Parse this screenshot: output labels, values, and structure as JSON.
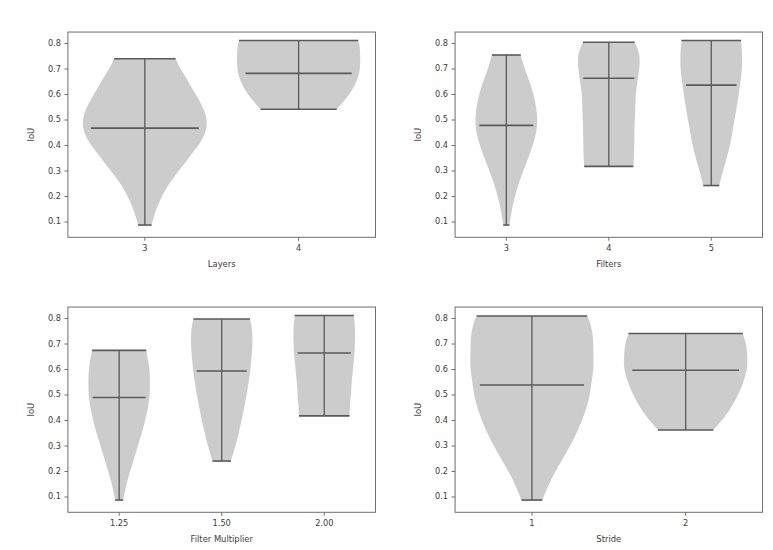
{
  "figure": {
    "kind": "violin-plot-grid",
    "rows": 2,
    "cols": 2,
    "shared_ylabel": "IoU",
    "fill_color": "#c8c8c8",
    "line_color": "#5a5a5a",
    "axis_color": "#6e6e6e",
    "background": "#ffffff"
  },
  "chart_data": [
    {
      "type": "violin",
      "panel": "top-left",
      "title": "",
      "xlabel": "Layers",
      "ylabel": "IoU",
      "ylim": [
        0.04,
        0.845
      ],
      "yticks": [
        0.1,
        0.2,
        0.3,
        0.4,
        0.5,
        0.6,
        0.7,
        0.8
      ],
      "ytick_labels": [
        "0.1",
        "0.2",
        "0.3",
        "0.4",
        "0.5",
        "0.6",
        "0.7",
        "0.8"
      ],
      "categories": [
        "3",
        "4"
      ],
      "grid": false,
      "legend": "none",
      "groups": [
        {
          "label": "3",
          "min": 0.088,
          "max": 0.74,
          "mean": 0.468,
          "max_width": 0.4,
          "profile": [
            {
              "y": 0.088,
              "w": 0.11
            },
            {
              "y": 0.13,
              "w": 0.16
            },
            {
              "y": 0.18,
              "w": 0.24
            },
            {
              "y": 0.24,
              "w": 0.37
            },
            {
              "y": 0.3,
              "w": 0.55
            },
            {
              "y": 0.36,
              "w": 0.74
            },
            {
              "y": 0.42,
              "w": 0.92
            },
            {
              "y": 0.47,
              "w": 1.0
            },
            {
              "y": 0.52,
              "w": 0.99
            },
            {
              "y": 0.57,
              "w": 0.9
            },
            {
              "y": 0.62,
              "w": 0.78
            },
            {
              "y": 0.67,
              "w": 0.66
            },
            {
              "y": 0.71,
              "w": 0.56
            },
            {
              "y": 0.74,
              "w": 0.5
            }
          ]
        },
        {
          "label": "4",
          "min": 0.542,
          "max": 0.812,
          "mean": 0.683,
          "max_width": 0.4,
          "profile": [
            {
              "y": 0.542,
              "w": 0.62
            },
            {
              "y": 0.57,
              "w": 0.72
            },
            {
              "y": 0.6,
              "w": 0.82
            },
            {
              "y": 0.64,
              "w": 0.92
            },
            {
              "y": 0.68,
              "w": 0.98
            },
            {
              "y": 0.72,
              "w": 1.0
            },
            {
              "y": 0.76,
              "w": 1.0
            },
            {
              "y": 0.79,
              "w": 0.99
            },
            {
              "y": 0.812,
              "w": 0.97
            }
          ]
        }
      ]
    },
    {
      "type": "violin",
      "panel": "top-right",
      "title": "",
      "xlabel": "Filters",
      "ylabel": "IoU",
      "ylim": [
        0.04,
        0.845
      ],
      "yticks": [
        0.1,
        0.2,
        0.3,
        0.4,
        0.5,
        0.6,
        0.7,
        0.8
      ],
      "ytick_labels": [
        "0.1",
        "0.2",
        "0.3",
        "0.4",
        "0.5",
        "0.6",
        "0.7",
        "0.8"
      ],
      "categories": [
        "3",
        "4",
        "5"
      ],
      "grid": false,
      "legend": "none",
      "groups": [
        {
          "label": "3",
          "min": 0.088,
          "max": 0.755,
          "mean": 0.479,
          "max_width": 0.3,
          "profile": [
            {
              "y": 0.088,
              "w": 0.1
            },
            {
              "y": 0.14,
              "w": 0.17
            },
            {
              "y": 0.19,
              "w": 0.26
            },
            {
              "y": 0.25,
              "w": 0.4
            },
            {
              "y": 0.31,
              "w": 0.58
            },
            {
              "y": 0.37,
              "w": 0.77
            },
            {
              "y": 0.43,
              "w": 0.93
            },
            {
              "y": 0.48,
              "w": 1.0
            },
            {
              "y": 0.53,
              "w": 0.99
            },
            {
              "y": 0.58,
              "w": 0.92
            },
            {
              "y": 0.63,
              "w": 0.81
            },
            {
              "y": 0.68,
              "w": 0.66
            },
            {
              "y": 0.72,
              "w": 0.55
            },
            {
              "y": 0.755,
              "w": 0.47
            }
          ]
        },
        {
          "label": "4",
          "min": 0.318,
          "max": 0.805,
          "mean": 0.664,
          "max_width": 0.3,
          "profile": [
            {
              "y": 0.318,
              "w": 0.8
            },
            {
              "y": 0.36,
              "w": 0.82
            },
            {
              "y": 0.42,
              "w": 0.83
            },
            {
              "y": 0.48,
              "w": 0.84
            },
            {
              "y": 0.54,
              "w": 0.86
            },
            {
              "y": 0.6,
              "w": 0.88
            },
            {
              "y": 0.65,
              "w": 0.93
            },
            {
              "y": 0.7,
              "w": 0.99
            },
            {
              "y": 0.745,
              "w": 1.0
            },
            {
              "y": 0.78,
              "w": 0.93
            },
            {
              "y": 0.805,
              "w": 0.84
            }
          ]
        },
        {
          "label": "5",
          "min": 0.243,
          "max": 0.812,
          "mean": 0.637,
          "max_width": 0.3,
          "profile": [
            {
              "y": 0.243,
              "w": 0.26
            },
            {
              "y": 0.29,
              "w": 0.36
            },
            {
              "y": 0.35,
              "w": 0.5
            },
            {
              "y": 0.41,
              "w": 0.62
            },
            {
              "y": 0.47,
              "w": 0.71
            },
            {
              "y": 0.53,
              "w": 0.8
            },
            {
              "y": 0.59,
              "w": 0.88
            },
            {
              "y": 0.65,
              "w": 0.95
            },
            {
              "y": 0.71,
              "w": 1.0
            },
            {
              "y": 0.76,
              "w": 1.0
            },
            {
              "y": 0.812,
              "w": 0.97
            }
          ]
        }
      ]
    },
    {
      "type": "violin",
      "panel": "bottom-left",
      "title": "",
      "xlabel": "Filter Multiplier",
      "ylabel": "IoU",
      "ylim": [
        0.04,
        0.845
      ],
      "yticks": [
        0.1,
        0.2,
        0.3,
        0.4,
        0.5,
        0.6,
        0.7,
        0.8
      ],
      "ytick_labels": [
        "0.1",
        "0.2",
        "0.3",
        "0.4",
        "0.5",
        "0.6",
        "0.7",
        "0.8"
      ],
      "categories": [
        "1.25",
        "1.50",
        "2.00"
      ],
      "grid": false,
      "legend": "none",
      "groups": [
        {
          "label": "1.25",
          "min": 0.088,
          "max": 0.675,
          "mean": 0.49,
          "max_width": 0.3,
          "profile": [
            {
              "y": 0.088,
              "w": 0.13
            },
            {
              "y": 0.14,
              "w": 0.22
            },
            {
              "y": 0.19,
              "w": 0.33
            },
            {
              "y": 0.25,
              "w": 0.48
            },
            {
              "y": 0.31,
              "w": 0.63
            },
            {
              "y": 0.37,
              "w": 0.78
            },
            {
              "y": 0.43,
              "w": 0.9
            },
            {
              "y": 0.49,
              "w": 0.98
            },
            {
              "y": 0.54,
              "w": 1.0
            },
            {
              "y": 0.59,
              "w": 0.99
            },
            {
              "y": 0.63,
              "w": 0.95
            },
            {
              "y": 0.675,
              "w": 0.88
            }
          ]
        },
        {
          "label": "1.50",
          "min": 0.241,
          "max": 0.798,
          "mean": 0.594,
          "max_width": 0.3,
          "profile": [
            {
              "y": 0.241,
              "w": 0.3
            },
            {
              "y": 0.29,
              "w": 0.42
            },
            {
              "y": 0.35,
              "w": 0.55
            },
            {
              "y": 0.41,
              "w": 0.66
            },
            {
              "y": 0.47,
              "w": 0.76
            },
            {
              "y": 0.53,
              "w": 0.85
            },
            {
              "y": 0.59,
              "w": 0.92
            },
            {
              "y": 0.65,
              "w": 0.97
            },
            {
              "y": 0.71,
              "w": 1.0
            },
            {
              "y": 0.76,
              "w": 0.98
            },
            {
              "y": 0.798,
              "w": 0.92
            }
          ]
        },
        {
          "label": "2.00",
          "min": 0.418,
          "max": 0.812,
          "mean": 0.665,
          "max_width": 0.3,
          "profile": [
            {
              "y": 0.418,
              "w": 0.82
            },
            {
              "y": 0.46,
              "w": 0.84
            },
            {
              "y": 0.51,
              "w": 0.87
            },
            {
              "y": 0.56,
              "w": 0.9
            },
            {
              "y": 0.61,
              "w": 0.94
            },
            {
              "y": 0.66,
              "w": 0.98
            },
            {
              "y": 0.71,
              "w": 1.0
            },
            {
              "y": 0.76,
              "w": 1.0
            },
            {
              "y": 0.812,
              "w": 0.96
            }
          ]
        }
      ]
    },
    {
      "type": "violin",
      "panel": "bottom-right",
      "title": "",
      "xlabel": "Stride",
      "ylabel": "IoU",
      "ylim": [
        0.04,
        0.845
      ],
      "yticks": [
        0.1,
        0.2,
        0.3,
        0.4,
        0.5,
        0.6,
        0.7,
        0.8
      ],
      "ytick_labels": [
        "0.1",
        "0.2",
        "0.3",
        "0.4",
        "0.5",
        "0.6",
        "0.7",
        "0.8"
      ],
      "categories": [
        "1",
        "2"
      ],
      "grid": false,
      "legend": "none",
      "groups": [
        {
          "label": "1",
          "min": 0.088,
          "max": 0.81,
          "mean": 0.539,
          "max_width": 0.4,
          "profile": [
            {
              "y": 0.088,
              "w": 0.17
            },
            {
              "y": 0.14,
              "w": 0.26
            },
            {
              "y": 0.19,
              "w": 0.36
            },
            {
              "y": 0.25,
              "w": 0.5
            },
            {
              "y": 0.31,
              "w": 0.64
            },
            {
              "y": 0.37,
              "w": 0.76
            },
            {
              "y": 0.43,
              "w": 0.86
            },
            {
              "y": 0.49,
              "w": 0.93
            },
            {
              "y": 0.55,
              "w": 0.97
            },
            {
              "y": 0.61,
              "w": 1.0
            },
            {
              "y": 0.67,
              "w": 1.0
            },
            {
              "y": 0.73,
              "w": 0.99
            },
            {
              "y": 0.78,
              "w": 0.95
            },
            {
              "y": 0.81,
              "w": 0.9
            }
          ]
        },
        {
          "label": "2",
          "min": 0.363,
          "max": 0.741,
          "mean": 0.597,
          "max_width": 0.4,
          "profile": [
            {
              "y": 0.363,
              "w": 0.45
            },
            {
              "y": 0.41,
              "w": 0.62
            },
            {
              "y": 0.46,
              "w": 0.76
            },
            {
              "y": 0.51,
              "w": 0.87
            },
            {
              "y": 0.56,
              "w": 0.95
            },
            {
              "y": 0.61,
              "w": 1.0
            },
            {
              "y": 0.66,
              "w": 1.0
            },
            {
              "y": 0.7,
              "w": 0.98
            },
            {
              "y": 0.741,
              "w": 0.93
            }
          ]
        }
      ]
    }
  ]
}
